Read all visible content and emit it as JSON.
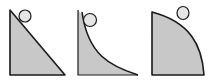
{
  "diagram": {
    "colors": {
      "fill": "#c8c8c8",
      "stroke": "#1a1a1a",
      "ball": "#e6e6e6",
      "background": "#ffffff"
    },
    "ramps": [
      {
        "id": "straight",
        "shape": "straight-incline"
      },
      {
        "id": "concave",
        "shape": "concave-curve"
      },
      {
        "id": "convex",
        "shape": "convex-curve"
      }
    ]
  }
}
